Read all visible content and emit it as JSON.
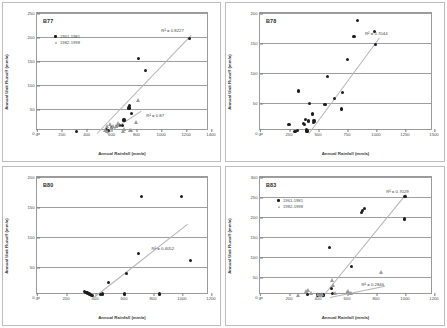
{
  "figure": {
    "title": "",
    "axis_titles": {
      "x": "Annual Rainfall (mm/a)",
      "y": "Annual Unit Runoff (mm/a)"
    },
    "legend_labels": {
      "series1": "1961-1981",
      "series2": "1982-1998"
    }
  },
  "chart_data": [
    {
      "type": "scatter",
      "title": "B77",
      "xlabel": "Annual Rainfall (mm/a)",
      "ylabel": "Annual Unit Runoff (mm/a)",
      "xlim": [
        0,
        1400
      ],
      "ylim": [
        0,
        250
      ],
      "xticks": [
        0,
        200,
        400,
        600,
        800,
        1000,
        1200,
        1400
      ],
      "yticks": [
        0,
        50,
        100,
        150,
        200,
        250
      ],
      "grid": "horizontal",
      "legend": {
        "position": "upper-left",
        "entries": [
          "1961-1981",
          "1982-1998"
        ]
      },
      "annotations": [
        {
          "text": "R² = 0.8227",
          "x": 1000,
          "y": 212
        },
        {
          "text": "R² = 0.87",
          "x": 880,
          "y": 35
        }
      ],
      "series": [
        {
          "name": "1961-1981",
          "marker": "filled-circle",
          "points": [
            [
              320,
              3
            ],
            [
              560,
              8
            ],
            [
              575,
              6
            ],
            [
              600,
              11
            ],
            [
              640,
              14
            ],
            [
              655,
              17
            ],
            [
              665,
              16
            ],
            [
              690,
              15
            ],
            [
              700,
              27
            ],
            [
              740,
              52
            ],
            [
              745,
              57
            ],
            [
              760,
              40
            ],
            [
              820,
              156
            ],
            [
              875,
              131
            ],
            [
              1225,
              196
            ]
          ]
        },
        {
          "name": "1982-1998",
          "marker": "open-triangle",
          "points": [
            [
              545,
              6
            ],
            [
              560,
              4
            ],
            [
              565,
              13
            ],
            [
              585,
              17
            ],
            [
              600,
              9
            ],
            [
              615,
              13
            ],
            [
              635,
              14
            ],
            [
              650,
              19
            ],
            [
              655,
              16
            ],
            [
              690,
              4
            ],
            [
              700,
              8
            ],
            [
              750,
              5
            ],
            [
              755,
              6
            ],
            [
              800,
              22
            ],
            [
              810,
              67
            ]
          ]
        }
      ],
      "trendlines": [
        {
          "name": "1961-1981",
          "x1": 480,
          "y1": 0,
          "x2": 1240,
          "y2": 205
        },
        {
          "name": "1982-1998",
          "x1": 560,
          "y1": 0,
          "x2": 840,
          "y2": 47
        }
      ]
    },
    {
      "type": "scatter",
      "title": "B78",
      "xlabel": "Annual Rainfall (mm/a)",
      "ylabel": "Annual Unit Runoff (mm/a)",
      "xlim": [
        0,
        1500
      ],
      "ylim": [
        0,
        200
      ],
      "xticks": [
        0,
        250,
        500,
        750,
        1000,
        1250,
        1500
      ],
      "yticks": [
        0,
        50,
        100,
        150,
        200
      ],
      "grid": "horizontal",
      "legend": null,
      "annotations": [
        {
          "text": "R² = 0.7044",
          "x": 905,
          "y": 165
        }
      ],
      "series": [
        {
          "name": "all-years",
          "marker": "filled-circle",
          "points": [
            [
              250,
              14
            ],
            [
              300,
              3
            ],
            [
              305,
              2
            ],
            [
              325,
              4
            ],
            [
              330,
              70
            ],
            [
              375,
              16
            ],
            [
              385,
              14
            ],
            [
              395,
              22
            ],
            [
              400,
              5
            ],
            [
              405,
              3
            ],
            [
              410,
              4
            ],
            [
              420,
              20
            ],
            [
              425,
              49
            ],
            [
              450,
              33
            ],
            [
              455,
              31
            ],
            [
              460,
              18
            ],
            [
              465,
              21
            ],
            [
              470,
              20
            ],
            [
              560,
              47
            ],
            [
              580,
              94
            ],
            [
              640,
              58
            ],
            [
              700,
              40
            ],
            [
              710,
              68
            ],
            [
              755,
              122
            ],
            [
              810,
              161
            ],
            [
              840,
              187
            ],
            [
              985,
              169
            ],
            [
              995,
              147
            ]
          ]
        }
      ],
      "trendlines": [
        {
          "name": "all-years",
          "x1": 420,
          "y1": 0,
          "x2": 1030,
          "y2": 160
        }
      ]
    },
    {
      "type": "scatter",
      "title": "B80",
      "xlabel": "Annual Rainfall (mm/a)",
      "ylabel": "Annual Unit Runoff (mm/a)",
      "xlim": [
        0,
        1200
      ],
      "ylim": [
        0,
        200
      ],
      "xticks": [
        0,
        200,
        400,
        600,
        800,
        1000,
        1200
      ],
      "yticks": [
        0,
        50,
        100,
        150,
        200
      ],
      "grid": "horizontal",
      "legend": null,
      "annotations": [
        {
          "text": "R² = 0.4052",
          "x": 790,
          "y": 80
        }
      ],
      "series": [
        {
          "name": "all-years",
          "marker": "filled-circle",
          "points": [
            [
              330,
              9
            ],
            [
              338,
              8
            ],
            [
              345,
              7
            ],
            [
              352,
              6
            ],
            [
              360,
              5
            ],
            [
              368,
              4
            ],
            [
              375,
              3
            ],
            [
              385,
              3
            ],
            [
              440,
              4
            ],
            [
              450,
              5
            ],
            [
              490,
              24
            ],
            [
              605,
              5
            ],
            [
              615,
              39
            ],
            [
              700,
              72
            ],
            [
              720,
              167
            ],
            [
              845,
              5
            ],
            [
              995,
              168
            ],
            [
              1060,
              61
            ]
          ]
        }
      ],
      "trendlines": [
        {
          "name": "all-years",
          "x1": 390,
          "y1": 0,
          "x2": 1035,
          "y2": 122
        }
      ]
    },
    {
      "type": "scatter",
      "title": "B83",
      "xlabel": "Annual Rainfall (mm/a)",
      "ylabel": "Annual Unit Runoff (mm/a)",
      "xlim": [
        0,
        1200
      ],
      "ylim": [
        0,
        300
      ],
      "xticks": [
        0,
        200,
        400,
        600,
        800,
        1000,
        1200
      ],
      "yticks": [
        0,
        50,
        100,
        150,
        200,
        250,
        300
      ],
      "grid": "horizontal",
      "legend": {
        "position": "upper-left",
        "entries": [
          "1961-1981",
          "1982-1998"
        ]
      },
      "annotations": [
        {
          "text": "R² = 0.7029",
          "x": 870,
          "y": 262
        },
        {
          "text": "R² = 0.2846",
          "x": 700,
          "y": 30
        }
      ],
      "series": [
        {
          "name": "1961-1981",
          "marker": "filled-circle",
          "points": [
            [
              330,
              6
            ],
            [
              400,
              5
            ],
            [
              410,
              4
            ],
            [
              425,
              6
            ],
            [
              440,
              5
            ],
            [
              480,
              123
            ],
            [
              490,
              21
            ],
            [
              500,
              9
            ],
            [
              630,
              77
            ],
            [
              700,
              212
            ],
            [
              710,
              217
            ],
            [
              720,
              222
            ],
            [
              995,
              195
            ],
            [
              1000,
              252
            ]
          ]
        },
        {
          "name": "1982-1998",
          "marker": "open-triangle",
          "points": [
            [
              265,
              5
            ],
            [
              320,
              13
            ],
            [
              335,
              16
            ],
            [
              355,
              9
            ],
            [
              400,
              6
            ],
            [
              415,
              5
            ],
            [
              430,
              6
            ],
            [
              495,
              41
            ],
            [
              505,
              30
            ],
            [
              520,
              9
            ],
            [
              600,
              12
            ],
            [
              610,
              15
            ],
            [
              620,
              10
            ],
            [
              630,
              8
            ],
            [
              835,
              62
            ]
          ]
        }
      ],
      "trendlines": [
        {
          "name": "1961-1981",
          "x1": 430,
          "y1": 0,
          "x2": 1010,
          "y2": 258
        },
        {
          "name": "1982-1998",
          "x1": 480,
          "y1": 0,
          "x2": 860,
          "y2": 28
        }
      ]
    }
  ]
}
